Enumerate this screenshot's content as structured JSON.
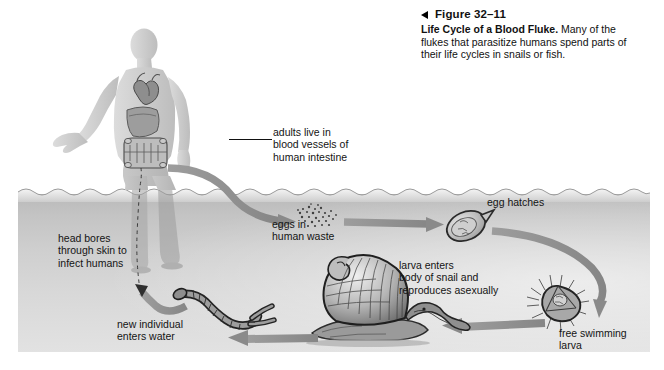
{
  "caption": {
    "marker_icon": "left-triangle-icon",
    "figure_number": "Figure 32–11",
    "title": "Life Cycle of a Blood Fluke.",
    "text": " Many of the flukes that parasitize humans spend parts of their life cycles in snails or fish."
  },
  "diagram": {
    "title": "Life Cycle of a Blood Fluke",
    "labels": {
      "adults": "adults live in\nblood vessels of\nhuman intestine",
      "eggs": "eggs in\nhuman waste",
      "egg_hatches": "egg hatches",
      "larva_snail": "larva enters\nbody of snail and\nreproduces asexually",
      "free_larva": "free swimming\nlarva",
      "new_individual": "new individual\nenters water",
      "head_bores": "head bores\nthrough skin to\ninfect humans"
    },
    "organisms": {
      "human": "human-figure",
      "heart": "heart-organ",
      "liver": "liver-organ",
      "intestine": "intestine-organ",
      "eggs_cluster": "eggs-in-waste",
      "egg": "fluke-egg",
      "miracidium": "free-swimming-larva",
      "snail": "snail",
      "cercaria": "forked-tail-cercaria"
    },
    "colors": {
      "water_top": "#b9b9b9",
      "water_bottom": "#e2e2e2",
      "arrow": "#8f8f8f",
      "body": "#cfcfcf",
      "text": "#141414",
      "page": "#ffffff"
    },
    "arrow_count": 6
  }
}
